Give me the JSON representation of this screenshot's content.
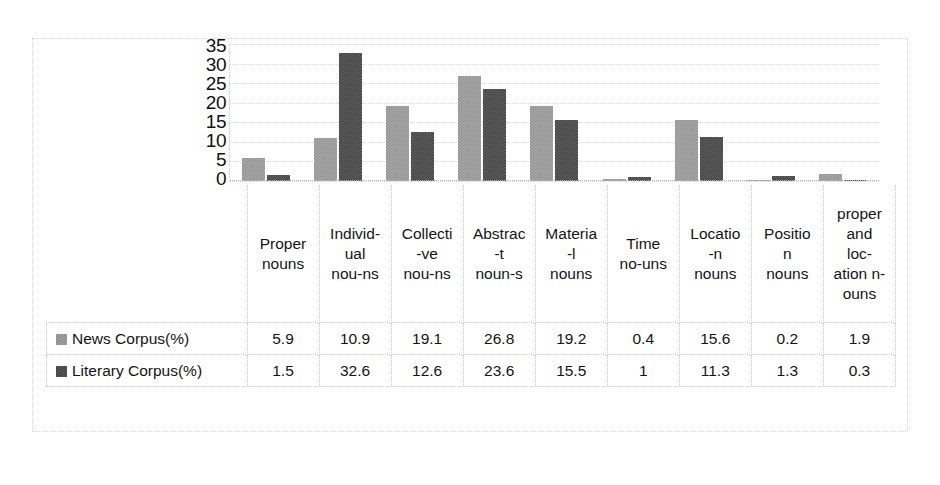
{
  "chart_data": {
    "type": "bar",
    "title": "",
    "xlabel": "",
    "ylabel": "",
    "ylim": [
      0,
      35
    ],
    "yticks": [
      35,
      30,
      25,
      20,
      15,
      10,
      5,
      0
    ],
    "grid": true,
    "legend_position": "table-left",
    "categories": [
      "Proper nouns",
      "Individ-ual nou-ns",
      "Collecti -ve nou-ns",
      "Abstrac -t noun-s",
      "Materia -l nouns",
      "Time no-uns",
      "Locatio -n nouns",
      "Positio n nouns",
      "proper and loc-ation n-ouns"
    ],
    "category_lines": [
      [
        "Proper",
        "nouns"
      ],
      [
        "Individ-",
        "ual",
        "nou-ns"
      ],
      [
        "Collecti",
        "-ve",
        "nou-ns"
      ],
      [
        "Abstrac",
        "-t",
        "noun-s"
      ],
      [
        "Materia",
        "-l",
        "nouns"
      ],
      [
        "Time",
        "no-uns"
      ],
      [
        "Locatio",
        "-n",
        "nouns"
      ],
      [
        "Positio",
        "n",
        "nouns"
      ],
      [
        "proper",
        "and",
        "loc-",
        "ation n-",
        "ouns"
      ]
    ],
    "series": [
      {
        "name": "News Corpus(%)",
        "color": "#a8a8a8",
        "values": [
          5.9,
          10.9,
          19.1,
          26.8,
          19.2,
          0.4,
          15.6,
          0.2,
          1.9
        ]
      },
      {
        "name": "Literary Corpus(%)",
        "color": "#5d5d5d",
        "values": [
          1.5,
          32.6,
          12.6,
          23.6,
          15.5,
          1,
          11.3,
          1.3,
          0.3
        ]
      }
    ]
  },
  "table": {
    "row_labels": [
      "News Corpus(%)",
      "Literary Corpus(%)"
    ]
  }
}
